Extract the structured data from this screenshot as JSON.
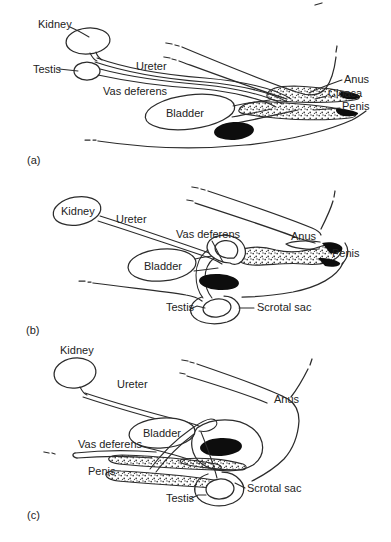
{
  "figure_name": "male-urogenital-anatomy-comparison",
  "colors": {
    "line": "#2b2b2b",
    "black_fill": "#0d0d0d",
    "background": "#ffffff",
    "stipple_dot": "#3a3a3a"
  },
  "panels": {
    "a": {
      "tag": "(a)",
      "labels": {
        "kidney": "Kidney",
        "testis": "Testis",
        "ureter": "Ureter",
        "vas_deferens": "Vas deferens",
        "bladder": "Bladder",
        "anus": "Anus",
        "cloaca": "Cloaca",
        "penis": "Penis"
      }
    },
    "b": {
      "tag": "(b)",
      "labels": {
        "kidney": "Kidney",
        "ureter": "Ureter",
        "vas_deferens": "Vas deferens",
        "bladder": "Bladder",
        "anus": "Anus",
        "penis": "Penis",
        "testis": "Testis",
        "scrotal_sac": "Scrotal sac"
      }
    },
    "c": {
      "tag": "(c)",
      "labels": {
        "kidney": "Kidney",
        "ureter": "Ureter",
        "anus": "Anus",
        "bladder": "Bladder",
        "vas_deferens": "Vas deferens",
        "penis": "Penis",
        "testis": "Testis",
        "scrotal_sac": "Scrotal sac"
      }
    }
  }
}
